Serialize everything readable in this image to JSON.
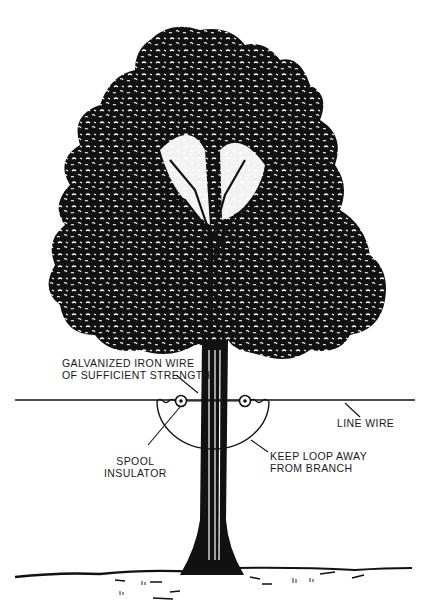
{
  "diagram": {
    "colors": {
      "ink": "#111111",
      "paper": "#ffffff"
    },
    "labels": {
      "galvanized_wire": [
        "GALVANIZED IRON WIRE",
        "OF SUFFICIENT STRENGTH"
      ],
      "line_wire": "LINE WIRE",
      "spool_insulator": [
        "SPOOL",
        "INSULATOR"
      ],
      "keep_loop": [
        "KEEP LOOP AWAY",
        "FROM BRANCH"
      ]
    },
    "elements": [
      "tree-canopy",
      "tree-trunk",
      "line-wire",
      "spool-insulator-left",
      "spool-insulator-right",
      "wire-loop",
      "ground-line"
    ]
  }
}
